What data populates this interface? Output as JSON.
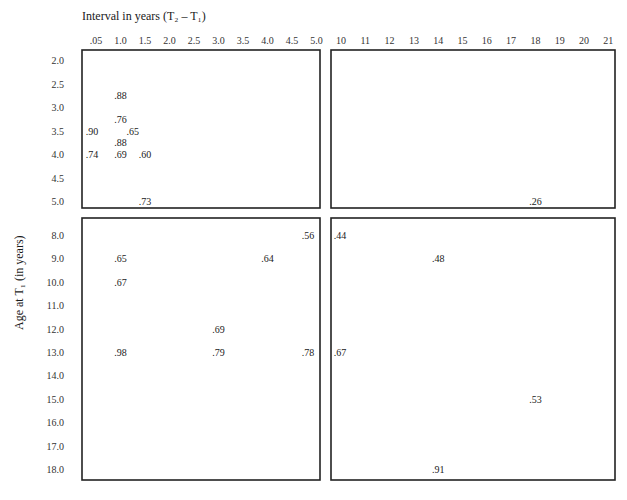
{
  "chart_data": {
    "type": "table",
    "title": "",
    "xlabel": "Interval in years (T₂ – T₁)",
    "ylabel": "Age at T₁ (in years)",
    "x_ticks_left": [
      ".05",
      "1.0",
      "1.5",
      "2.0",
      "2.5",
      "3.0",
      "3.5",
      "4.0",
      "4.5",
      "5.0"
    ],
    "x_ticks_right": [
      "10",
      "11",
      "12",
      "13",
      "14",
      "15",
      "16",
      "17",
      "18",
      "19",
      "20",
      "21"
    ],
    "y_ticks_top": [
      "2.0",
      "2.5",
      "3.0",
      "3.5",
      "4.0",
      "4.5",
      "5.0"
    ],
    "y_ticks_bottom": [
      "8.0",
      "9.0",
      "10.0",
      "11.0",
      "12.0",
      "13.0",
      "14.0",
      "15.0",
      "16.0",
      "17.0",
      "18.0"
    ],
    "points": [
      {
        "age": "2.75",
        "interval": "1.0",
        "value": ".88",
        "panel": "top-left"
      },
      {
        "age": "3.25",
        "interval": "1.0",
        "value": ".76",
        "panel": "top-left"
      },
      {
        "age": "3.5",
        "interval": ".05",
        "value": ".90",
        "panel": "top-left"
      },
      {
        "age": "3.5",
        "interval": "1.25",
        "value": ".65",
        "panel": "top-left"
      },
      {
        "age": "3.75",
        "interval": "1.0",
        "value": ".88",
        "panel": "top-left"
      },
      {
        "age": "4.0",
        "interval": ".05",
        "value": ".74",
        "panel": "top-left"
      },
      {
        "age": "4.0",
        "interval": "1.0",
        "value": ".69",
        "panel": "top-left"
      },
      {
        "age": "4.0",
        "interval": "1.5",
        "value": ".60",
        "panel": "top-left"
      },
      {
        "age": "5.0",
        "interval": "1.5",
        "value": ".73",
        "panel": "top-left"
      },
      {
        "age": "5.0",
        "interval": "18",
        "value": ".26",
        "panel": "top-right"
      },
      {
        "age": "8.0",
        "interval": "5.0",
        "value": ".56",
        "panel": "bottom-left"
      },
      {
        "age": "9.0",
        "interval": "1.0",
        "value": ".65",
        "panel": "bottom-left"
      },
      {
        "age": "9.0",
        "interval": "4.0",
        "value": ".64",
        "panel": "bottom-left"
      },
      {
        "age": "10.0",
        "interval": "1.0",
        "value": ".67",
        "panel": "bottom-left"
      },
      {
        "age": "12.0",
        "interval": "3.0",
        "value": ".69",
        "panel": "bottom-left"
      },
      {
        "age": "13.0",
        "interval": "1.0",
        "value": ".98",
        "panel": "bottom-left"
      },
      {
        "age": "13.0",
        "interval": "3.0",
        "value": ".79",
        "panel": "bottom-left"
      },
      {
        "age": "13.0",
        "interval": "5.0",
        "value": ".78",
        "panel": "bottom-left"
      },
      {
        "age": "8.0",
        "interval": "10",
        "value": ".44",
        "panel": "bottom-right"
      },
      {
        "age": "9.0",
        "interval": "14",
        "value": ".48",
        "panel": "bottom-right"
      },
      {
        "age": "13.0",
        "interval": "10",
        "value": ".67",
        "panel": "bottom-right"
      },
      {
        "age": "15.0",
        "interval": "18",
        "value": ".53",
        "panel": "bottom-right"
      },
      {
        "age": "18.0",
        "interval": "14",
        "value": ".91",
        "panel": "bottom-right"
      }
    ],
    "grid": false,
    "legend": "none"
  }
}
